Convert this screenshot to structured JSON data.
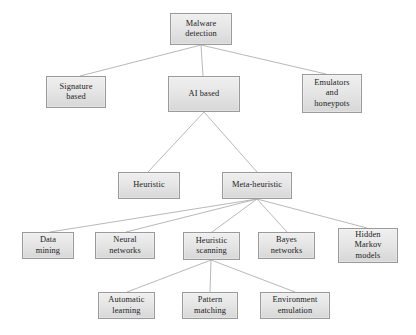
{
  "diagram": {
    "style": {
      "box_fill_top": "#efefef",
      "box_fill_bottom": "#d7d7d7",
      "box_border": "#9a9a9a",
      "edge_color": "#b0b0b0",
      "text_color": "#1c1c1c",
      "background": "#ffffff"
    },
    "nodes": [
      {
        "id": "malware-detection",
        "label": "Malware\ndetection",
        "x": 170,
        "y": 13,
        "w": 62,
        "h": 32
      },
      {
        "id": "signature-based",
        "label": "Signature\nbased",
        "x": 46,
        "y": 76,
        "w": 60,
        "h": 32
      },
      {
        "id": "ai-based",
        "label": "AI based",
        "x": 168,
        "y": 76,
        "w": 72,
        "h": 36
      },
      {
        "id": "emulators-honeypots",
        "label": "Emulators\nand\nhoneypots",
        "x": 302,
        "y": 74,
        "w": 60,
        "h": 39
      },
      {
        "id": "heuristic",
        "label": "Heuristic",
        "x": 118,
        "y": 172,
        "w": 62,
        "h": 27
      },
      {
        "id": "meta-heuristic",
        "label": "Meta-heuristic",
        "x": 222,
        "y": 172,
        "w": 70,
        "h": 27
      },
      {
        "id": "data-mining",
        "label": "Data\nmining",
        "x": 22,
        "y": 232,
        "w": 52,
        "h": 27
      },
      {
        "id": "neural-networks",
        "label": "Neural\nnetworks",
        "x": 95,
        "y": 232,
        "w": 60,
        "h": 27
      },
      {
        "id": "heuristic-scanning",
        "label": "Heuristic\nscanning",
        "x": 183,
        "y": 232,
        "w": 57,
        "h": 28
      },
      {
        "id": "bayes-networks",
        "label": "Bayes\nnetworks",
        "x": 258,
        "y": 232,
        "w": 57,
        "h": 27
      },
      {
        "id": "hidden-markov",
        "label": "Hidden\nMarkov\nmodels",
        "x": 338,
        "y": 228,
        "w": 60,
        "h": 35
      },
      {
        "id": "automatic-learning",
        "label": "Automatic\nlearning",
        "x": 98,
        "y": 292,
        "w": 57,
        "h": 27
      },
      {
        "id": "pattern-matching",
        "label": "Pattern\nmatching",
        "x": 182,
        "y": 292,
        "w": 56,
        "h": 27
      },
      {
        "id": "environment-emulation",
        "label": "Environment\nemulation",
        "x": 260,
        "y": 292,
        "w": 70,
        "h": 27
      }
    ],
    "edges": [
      {
        "from": "malware-detection",
        "to": "signature-based",
        "x1": 201,
        "y1": 45,
        "x2": 80,
        "y2": 76
      },
      {
        "from": "malware-detection",
        "to": "ai-based",
        "x1": 201,
        "y1": 45,
        "x2": 203,
        "y2": 76
      },
      {
        "from": "malware-detection",
        "to": "emulators-honeypots",
        "x1": 201,
        "y1": 45,
        "x2": 326,
        "y2": 74
      },
      {
        "from": "ai-based",
        "to": "heuristic",
        "x1": 204,
        "y1": 112,
        "x2": 148,
        "y2": 172
      },
      {
        "from": "ai-based",
        "to": "meta-heuristic",
        "x1": 204,
        "y1": 112,
        "x2": 257,
        "y2": 172
      },
      {
        "from": "meta-heuristic",
        "to": "data-mining",
        "x1": 257,
        "y1": 199,
        "x2": 50,
        "y2": 232
      },
      {
        "from": "meta-heuristic",
        "to": "neural-networks",
        "x1": 257,
        "y1": 199,
        "x2": 126,
        "y2": 232
      },
      {
        "from": "meta-heuristic",
        "to": "heuristic-scanning",
        "x1": 257,
        "y1": 199,
        "x2": 212,
        "y2": 232
      },
      {
        "from": "meta-heuristic",
        "to": "bayes-networks",
        "x1": 257,
        "y1": 199,
        "x2": 287,
        "y2": 232
      },
      {
        "from": "meta-heuristic",
        "to": "hidden-markov",
        "x1": 257,
        "y1": 199,
        "x2": 367,
        "y2": 228
      },
      {
        "from": "heuristic-scanning",
        "to": "automatic-learning",
        "x1": 211,
        "y1": 260,
        "x2": 127,
        "y2": 292
      },
      {
        "from": "heuristic-scanning",
        "to": "pattern-matching",
        "x1": 211,
        "y1": 260,
        "x2": 210,
        "y2": 292
      },
      {
        "from": "heuristic-scanning",
        "to": "environment-emulation",
        "x1": 211,
        "y1": 260,
        "x2": 295,
        "y2": 292
      }
    ]
  }
}
